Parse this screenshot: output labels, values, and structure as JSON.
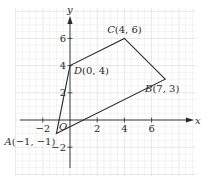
{
  "chart_data": {
    "type": "line",
    "title": "",
    "xlabel": "x",
    "ylabel": "y",
    "origin_label": "O",
    "xlim": [
      -4,
      9.5
    ],
    "ylim": [
      -4.2,
      8.2
    ],
    "grid": true,
    "x_ticks": [
      -2,
      2,
      4,
      6
    ],
    "y_ticks": [
      -2,
      2,
      4,
      6
    ],
    "x_tick_labels": [
      "−2",
      "2",
      "4",
      "6"
    ],
    "y_tick_labels": [
      "−2",
      "2",
      "4",
      "6"
    ],
    "polygon": {
      "name": "Quadrilateral ABCD",
      "closed": true,
      "points": [
        {
          "name": "A",
          "x": -1,
          "y": -1,
          "label": "A(−1, −1)"
        },
        {
          "name": "B",
          "x": 7,
          "y": 3,
          "label": "B(7, 3)"
        },
        {
          "name": "C",
          "x": 4,
          "y": 6,
          "label": "C(4, 6)"
        },
        {
          "name": "D",
          "x": 0,
          "y": 4,
          "label": "D(0, 4)"
        }
      ]
    },
    "colors": {
      "grid_minor": "#eaeaea",
      "grid_major": "#d6d6d6",
      "axis": "#2a2a2a",
      "polygon": "#2a2a2a"
    }
  }
}
